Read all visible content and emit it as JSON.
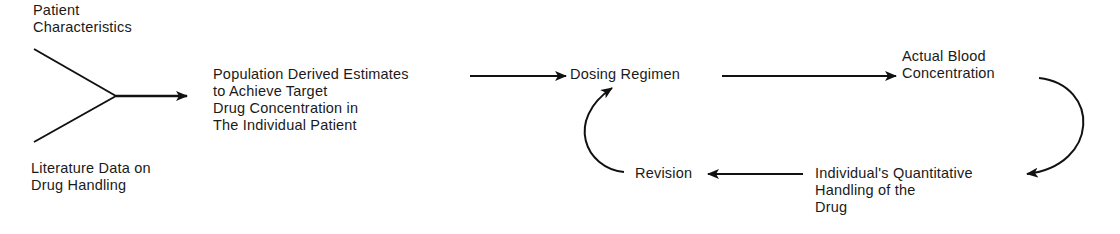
{
  "diagram": {
    "nodes": {
      "patient_characteristics": {
        "lines": [
          "Patient",
          "Characteristics"
        ]
      },
      "literature_data": {
        "lines": [
          "Literature Data on",
          "Drug Handling"
        ]
      },
      "population_estimates": {
        "lines": [
          "Population Derived Estimates",
          "to Achieve Target",
          "Drug Concentration in",
          "The Individual Patient"
        ]
      },
      "dosing_regimen": {
        "lines": [
          "Dosing Regimen"
        ]
      },
      "actual_blood_concentration": {
        "lines": [
          "Actual Blood",
          "Concentration"
        ]
      },
      "individual_handling": {
        "lines": [
          "Individual's Quantitative",
          "Handling of the",
          "Drug"
        ]
      },
      "revision": {
        "lines": [
          "Revision"
        ]
      }
    },
    "edges": [
      {
        "from": "patient_characteristics",
        "to": "population_estimates",
        "type": "merge"
      },
      {
        "from": "literature_data",
        "to": "population_estimates",
        "type": "merge"
      },
      {
        "from": "population_estimates",
        "to": "dosing_regimen",
        "type": "arrow"
      },
      {
        "from": "dosing_regimen",
        "to": "actual_blood_concentration",
        "type": "arrow"
      },
      {
        "from": "actual_blood_concentration",
        "to": "individual_handling",
        "type": "curved-arrow"
      },
      {
        "from": "individual_handling",
        "to": "revision",
        "type": "arrow"
      },
      {
        "from": "revision",
        "to": "dosing_regimen",
        "type": "curved-arrow"
      }
    ],
    "colors": {
      "stroke": "#111111",
      "text": "#1a1a1a",
      "background": "#ffffff"
    }
  }
}
